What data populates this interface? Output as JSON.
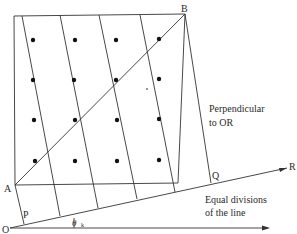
{
  "diagram": {
    "points": {
      "O": {
        "label": "O",
        "x": 10,
        "y": 228
      },
      "A": {
        "label": "A",
        "x": 15,
        "y": 185
      },
      "B": {
        "label": "B",
        "x": 185,
        "y": 14
      },
      "P": {
        "label": "P",
        "x": 22,
        "y": 220
      },
      "Q": {
        "label": "Q",
        "x": 213,
        "y": 180
      },
      "R": {
        "label": "R",
        "x": 289,
        "y": 167
      }
    },
    "annotations": {
      "perpendicular_line1": "Perpendicular",
      "perpendicular_line2": "to OR",
      "equal_line1": "Equal divisions",
      "equal_line2": "of the line",
      "angle_symbol": "θ",
      "angle_subscript": "k"
    },
    "dots_grid": {
      "rows": 4,
      "cols": 4
    },
    "colors": {
      "line": "#333333",
      "dot": "#111111",
      "text": "#2a2a2a"
    }
  }
}
